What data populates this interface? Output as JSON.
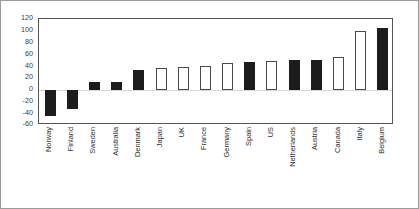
{
  "chart_data": {
    "type": "bar",
    "title": "",
    "subtitle": "",
    "xlabel": "",
    "ylabel": "",
    "ylim": [
      -60,
      120
    ],
    "ytick_step": 20,
    "yticks": [
      120,
      100,
      80,
      60,
      40,
      20,
      0,
      -20,
      -40,
      -60
    ],
    "ytick_labels": [
      "120",
      "100",
      "80",
      "60",
      "40",
      "20",
      "0",
      "-20",
      "-40",
      "-60"
    ],
    "grid": false,
    "zero_line": true,
    "legend": null,
    "legend_position": "none",
    "orientation": "vertical",
    "categories": [
      "Norway",
      "Finland",
      "Sweden",
      "Australia",
      "Denmark",
      "Japan",
      "UK",
      "France",
      "Germany",
      "Spain",
      "US",
      "Netherlands",
      "Austria",
      "Canada",
      "Italy",
      "Belgium"
    ],
    "values": [
      -45,
      -33,
      13,
      13,
      33,
      37,
      38,
      41,
      45,
      47,
      48,
      50,
      50,
      55,
      100,
      105
    ],
    "fill_styles": [
      "filled",
      "filled",
      "filled",
      "filled",
      "filled",
      "open",
      "open",
      "open",
      "open",
      "filled",
      "open",
      "filled",
      "filled",
      "open",
      "open",
      "filled"
    ],
    "colors": {
      "filled_bar": "#1c1c1c",
      "open_bar_face": "#ffffff",
      "open_bar_edge": "#4a4a4a",
      "axis": "#555555",
      "text": "#2f2f2f",
      "background": "#ffffff",
      "frame": "#9a9a9a"
    }
  }
}
